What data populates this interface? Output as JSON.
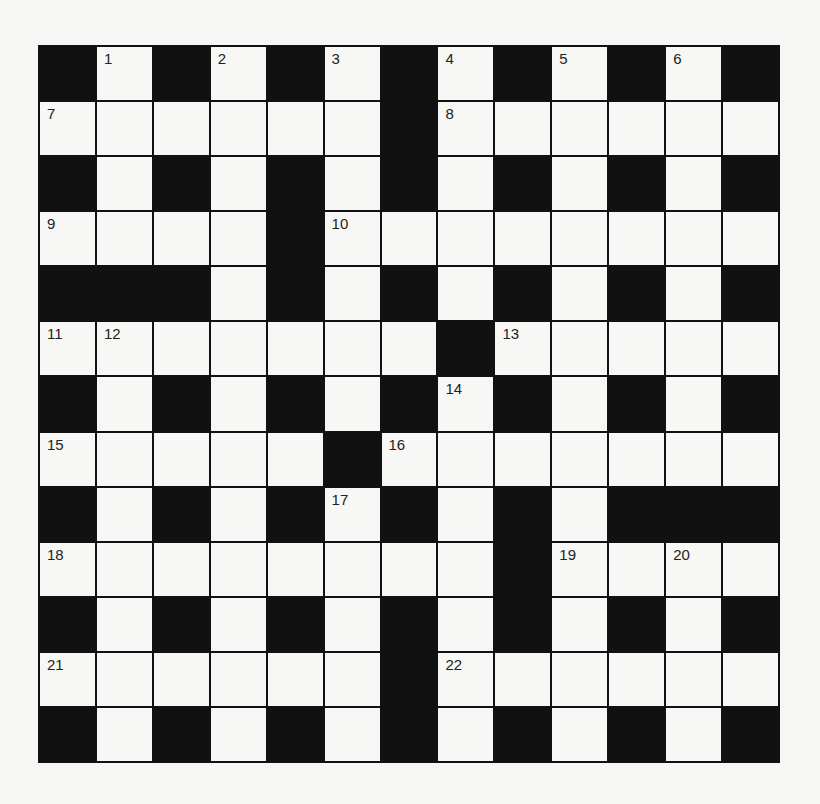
{
  "puzzle": {
    "rows": 13,
    "cols": 13,
    "layout": [
      "#.#.#.#.#.#.#",
      "......#......",
      "#.#.#.#.#.#.#",
      "....#........",
      "###.#.#.#.#.#",
      ".......#.....",
      "#.#.#.#.#.#.#",
      ".....#.......",
      "#.#.#.#.#.###",
      "........#....",
      "#.#.#.#.#.#.#",
      "......#......",
      "#.#.#.#.#.#.#"
    ],
    "numbers": [
      {
        "n": "1",
        "r": 0,
        "c": 1
      },
      {
        "n": "2",
        "r": 0,
        "c": 3
      },
      {
        "n": "3",
        "r": 0,
        "c": 5
      },
      {
        "n": "4",
        "r": 0,
        "c": 7
      },
      {
        "n": "5",
        "r": 0,
        "c": 9
      },
      {
        "n": "6",
        "r": 0,
        "c": 11
      },
      {
        "n": "7",
        "r": 1,
        "c": 0
      },
      {
        "n": "8",
        "r": 1,
        "c": 7
      },
      {
        "n": "9",
        "r": 3,
        "c": 0
      },
      {
        "n": "10",
        "r": 3,
        "c": 5
      },
      {
        "n": "11",
        "r": 5,
        "c": 0
      },
      {
        "n": "12",
        "r": 5,
        "c": 1
      },
      {
        "n": "13",
        "r": 5,
        "c": 8
      },
      {
        "n": "14",
        "r": 6,
        "c": 7
      },
      {
        "n": "15",
        "r": 7,
        "c": 0
      },
      {
        "n": "16",
        "r": 7,
        "c": 6
      },
      {
        "n": "17",
        "r": 8,
        "c": 5
      },
      {
        "n": "18",
        "r": 9,
        "c": 0
      },
      {
        "n": "19",
        "r": 9,
        "c": 9
      },
      {
        "n": "20",
        "r": 9,
        "c": 11
      },
      {
        "n": "21",
        "r": 11,
        "c": 0
      },
      {
        "n": "22",
        "r": 11,
        "c": 7
      }
    ]
  },
  "colors": {
    "block": "#111111",
    "cell": "#f7f7f5",
    "background": "#f6f6f4"
  }
}
